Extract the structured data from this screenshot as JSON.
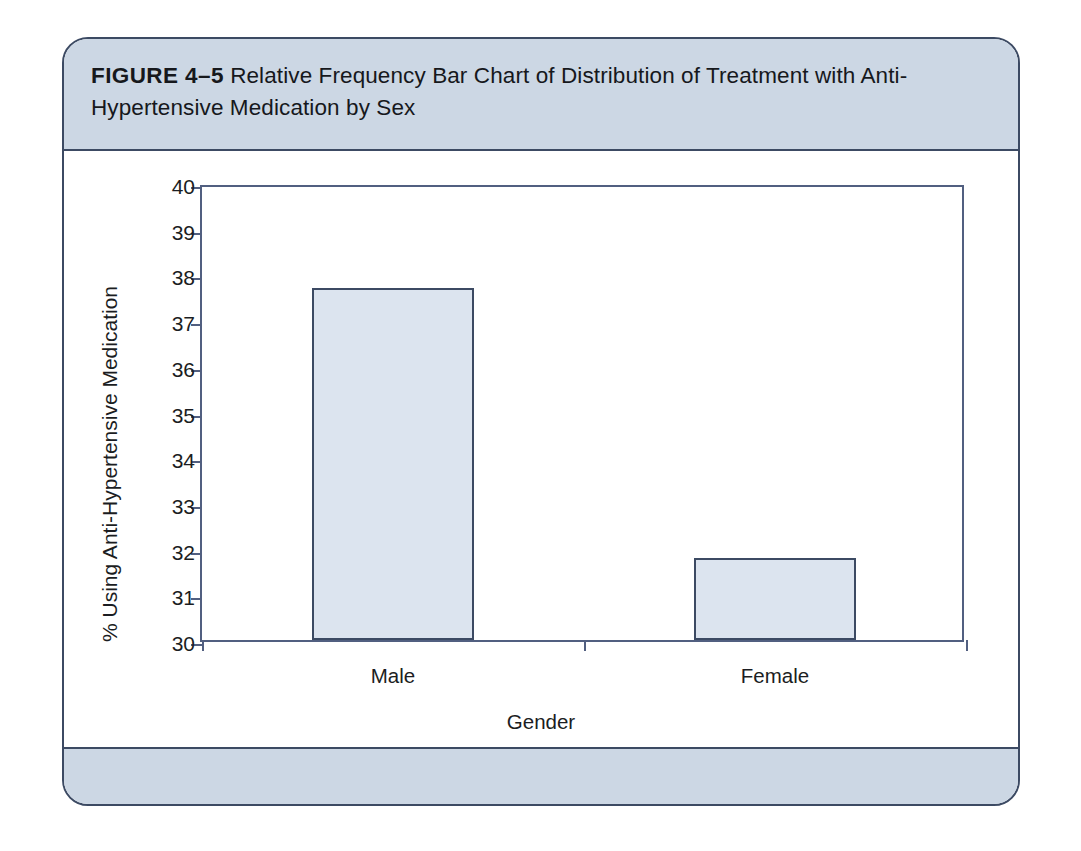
{
  "figure": {
    "label": "FIGURE 4–5",
    "caption": "Relative Frequency Bar Chart of Distribution of Treatment with Anti-Hypertensive Medication by Sex",
    "header_color": "#ccd7e4",
    "border_color": "#3c4a63"
  },
  "chart_data": {
    "type": "bar",
    "title": "Relative Frequency Bar Chart of Distribution of Treatment with Anti-Hypertensive Medication by Sex",
    "categories": [
      "Male",
      "Female"
    ],
    "values": [
      37.7,
      31.8
    ],
    "xlabel": "Gender",
    "ylabel": "% Using Anti-Hypertensive Medication",
    "ylim": [
      30,
      40
    ],
    "yticks": [
      30,
      31,
      32,
      33,
      34,
      35,
      36,
      37,
      38,
      39,
      40
    ],
    "ytick_labels": [
      "30",
      "31",
      "32",
      "33",
      "34",
      "35",
      "36",
      "37",
      "38",
      "39",
      "40"
    ],
    "grid": false,
    "legend": false,
    "bar_fill_color": "#dce4ef",
    "bar_border_color": "#3c4a63",
    "axis_color": "#515f80"
  }
}
